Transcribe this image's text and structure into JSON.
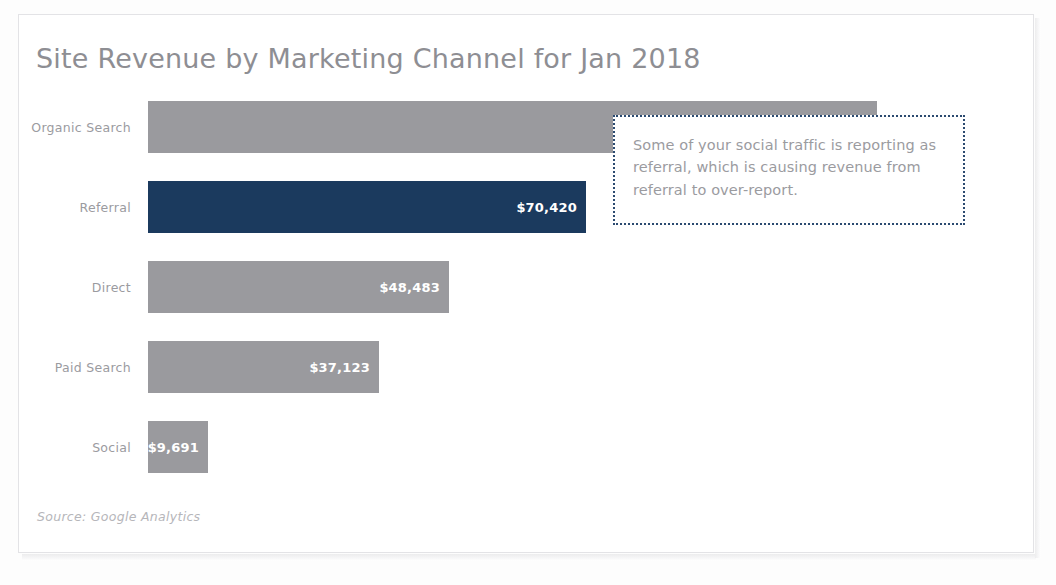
{
  "chart_data": {
    "type": "bar",
    "orientation": "horizontal",
    "title": "Site Revenue by Marketing Channel for Jan 2018",
    "xlabel": "",
    "ylabel": "",
    "grid": false,
    "legend": "none",
    "xlim": [
      0,
      117240
    ],
    "categories": [
      "Organic Search",
      "Referral",
      "Direct",
      "Paid Search",
      "Social"
    ],
    "values": [
      117240,
      70420,
      48483,
      37123,
      9691
    ],
    "value_labels": [
      "$117,240",
      "$70,420",
      "$48,483",
      "$37,123",
      "$9,691"
    ],
    "highlighted_category": "Referral",
    "colors": {
      "bar_default": "#9a9a9e",
      "bar_highlight": "#1b3a5e",
      "value_label": "#ffffff",
      "title": "#8e8e93",
      "category_label": "#9b9b9f",
      "annotation_border": "#2b4a70",
      "annotation_text": "#9b9b9f",
      "source_text": "#b6b6ba"
    },
    "annotations": [
      {
        "name": "referral-over-report-callout",
        "text": "Some of your social traffic is reporting as referral, which is causing revenue from referral to over-report."
      }
    ],
    "source": "Source: Google Analytics"
  },
  "chart": {
    "title": "Site Revenue by Marketing Channel for Jan 2018",
    "source": "Source: Google Analytics",
    "annotation": "Some of your social traffic is reporting as referral, which is causing revenue from referral to over-report.",
    "bars": [
      {
        "category": "Organic Search",
        "value": 117240,
        "label": "$117,240",
        "highlight": false
      },
      {
        "category": "Referral",
        "value": 70420,
        "label": "$70,420",
        "highlight": true
      },
      {
        "category": "Direct",
        "value": 48483,
        "label": "$48,483",
        "highlight": false
      },
      {
        "category": "Paid Search",
        "value": 37123,
        "label": "$37,123",
        "highlight": false
      },
      {
        "category": "Social",
        "value": 9691,
        "label": "$9,691",
        "highlight": false
      }
    ]
  }
}
